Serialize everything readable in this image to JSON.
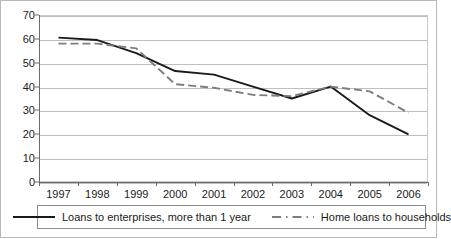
{
  "chart_data": {
    "type": "line",
    "title": "",
    "subtitle": "",
    "xlabel": "",
    "ylabel": "",
    "categories": [
      "1997",
      "1998",
      "1999",
      "2000",
      "2001",
      "2002",
      "2003",
      "2004",
      "2005",
      "2006"
    ],
    "ylim": [
      0,
      70
    ],
    "yticks": [
      0,
      10,
      20,
      30,
      40,
      50,
      60,
      70
    ],
    "ytick_labels": [
      "0",
      "10",
      "20",
      "30",
      "40",
      "50",
      "60",
      "70"
    ],
    "grid": true,
    "grid_axis": "y",
    "legend_position": "bottom",
    "series": [
      {
        "name": "Loans to enterprises, more than 1 year",
        "style": "solid",
        "color": "#1a1a1a",
        "values": [
          60.5,
          59.5,
          54.0,
          46.5,
          45.0,
          40.0,
          35.0,
          40.0,
          28.0,
          20.0
        ]
      },
      {
        "name": "Home loans to households",
        "style": "dashed",
        "color": "#7d7d7d",
        "values": [
          58.0,
          58.0,
          56.0,
          41.0,
          39.5,
          36.5,
          36.0,
          40.0,
          38.0,
          29.0
        ]
      }
    ]
  },
  "legend": {
    "entries": [
      {
        "label": "Loans to enterprises, more than 1 year"
      },
      {
        "label": "Home loans to households"
      }
    ]
  }
}
